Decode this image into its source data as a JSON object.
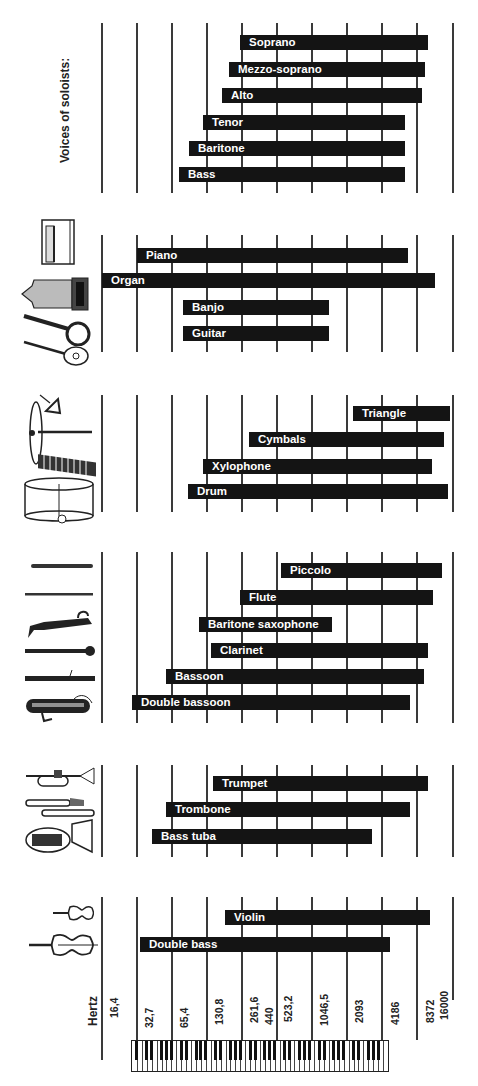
{
  "chart_data": {
    "type": "bar",
    "orientation": "horizontal-range",
    "xlabel": "Hertz",
    "scale": "log2 (one gridline per octave)",
    "x_ticks": [
      "16,4",
      "32,7",
      "65,4",
      "130,8",
      "261,6",
      "440",
      "523,2",
      "1046,5",
      "2093",
      "4186",
      "8372",
      "16000"
    ],
    "xlim": [
      16.4,
      16000
    ],
    "grid": true,
    "groups": [
      {
        "name": "Voices of soloists:",
        "items": [
          {
            "label": "Soprano",
            "low": 262,
            "high": 1500
          },
          {
            "label": "Mezzo-soprano",
            "low": 210,
            "high": 1400
          },
          {
            "label": "Alto",
            "low": 185,
            "high": 1330
          },
          {
            "label": "Tenor",
            "low": 125,
            "high": 880
          },
          {
            "label": "Baritone",
            "low": 95,
            "high": 880
          },
          {
            "label": "Bass",
            "low": 78,
            "high": 880
          }
        ]
      },
      {
        "name": "Keyboard and plucked strings",
        "items": [
          {
            "label": "Piano",
            "low": 27.5,
            "high": 4186
          },
          {
            "label": "Organ",
            "low": 16.4,
            "high": 8372
          },
          {
            "label": "Banjo",
            "low": 90,
            "high": 1600
          },
          {
            "label": "Guitar",
            "low": 90,
            "high": 1600
          }
        ]
      },
      {
        "name": "Percussion",
        "items": [
          {
            "label": "Triangle",
            "low": 3000,
            "high": 16000
          },
          {
            "label": "Cymbals",
            "low": 400,
            "high": 14000
          },
          {
            "label": "Xylophone",
            "low": 150,
            "high": 11000
          },
          {
            "label": "Drum",
            "low": 110,
            "high": 15500
          }
        ]
      },
      {
        "name": "Woodwinds",
        "items": [
          {
            "label": "Piccolo",
            "low": 590,
            "high": 12500
          },
          {
            "label": "Flute",
            "low": 262,
            "high": 10500
          },
          {
            "label": "Baritone saxophone",
            "low": 130,
            "high": 1900
          },
          {
            "label": "Clarinet",
            "low": 147,
            "high": 10000
          },
          {
            "label": "Bassoon",
            "low": 58,
            "high": 9000
          },
          {
            "label": "Double bassoon",
            "low": 29,
            "high": 6500
          }
        ]
      },
      {
        "name": "Brass",
        "items": [
          {
            "label": "Trumpet",
            "low": 165,
            "high": 10000
          },
          {
            "label": "Trombone",
            "low": 58,
            "high": 7000
          },
          {
            "label": "Bass tuba",
            "low": 44,
            "high": 3400
          }
        ]
      },
      {
        "name": "Strings",
        "items": [
          {
            "label": "Violin",
            "low": 196,
            "high": 11000
          },
          {
            "label": "Double bass",
            "low": 31,
            "high": 4500
          }
        ]
      }
    ]
  },
  "labels": {
    "voices_title": "Voices of soloists:",
    "axis_title": "Hertz",
    "ticks": [
      "16,4",
      "32,7",
      "65,4",
      "130,8",
      "261,6",
      "440",
      "523,2",
      "1046,5",
      "2093",
      "4186",
      "8372",
      "16000"
    ]
  },
  "bars": {
    "soprano": "Soprano",
    "mezzo": "Mezzo-soprano",
    "alto": "Alto",
    "tenor": "Tenor",
    "baritone": "Baritone",
    "bass": "Bass",
    "piano": "Piano",
    "organ": "Organ",
    "banjo": "Banjo",
    "guitar": "Guitar",
    "triangle": "Triangle",
    "cymbals": "Cymbals",
    "xylophone": "Xylophone",
    "drum": "Drum",
    "piccolo": "Piccolo",
    "flute": "Flute",
    "barsax": "Baritone saxophone",
    "clarinet": "Clarinet",
    "bassoon": "Bassoon",
    "dbassoon": "Double bassoon",
    "trumpet": "Trumpet",
    "trombone": "Trombone",
    "tuba": "Bass tuba",
    "violin": "Violin",
    "dbass": "Double bass"
  },
  "colors": {
    "bar": "#141414",
    "bar_text": "#ffffff",
    "grid": "#3a3a3a",
    "background": "#ffffff"
  }
}
